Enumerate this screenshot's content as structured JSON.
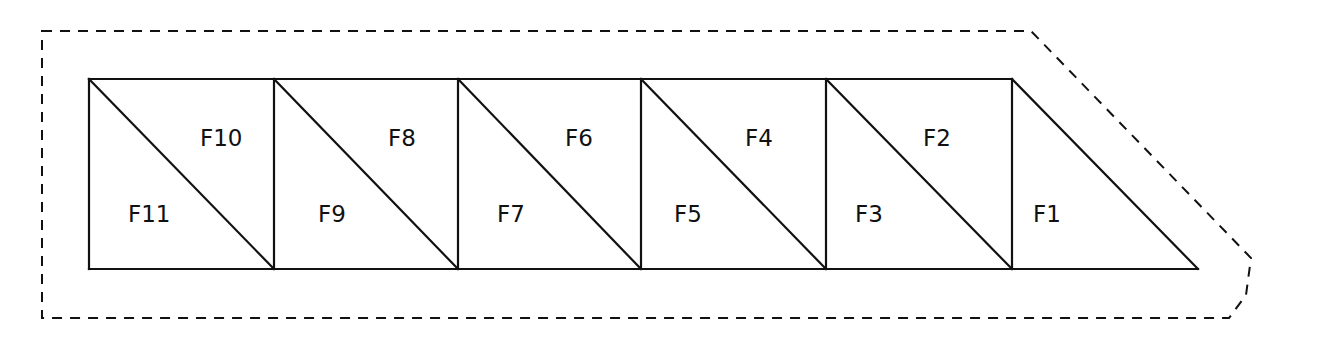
{
  "diagram": {
    "type": "truss-facet-layout",
    "outline": {
      "style": "dashed",
      "points": [
        [
          42,
          31
        ],
        [
          1031,
          31
        ],
        [
          1251,
          258
        ],
        [
          1246,
          295
        ],
        [
          1229,
          318
        ],
        [
          42,
          318
        ]
      ]
    },
    "truss": {
      "top_y": 79,
      "bottom_y": 269,
      "node_x": [
        89,
        274,
        458,
        641,
        826,
        1012
      ],
      "apex_x": 1198
    },
    "facets": [
      {
        "id": "F1",
        "label": "F1",
        "x": 1033,
        "y": 222
      },
      {
        "id": "F2",
        "label": "F2",
        "x": 923,
        "y": 146
      },
      {
        "id": "F3",
        "label": "F3",
        "x": 855,
        "y": 222
      },
      {
        "id": "F4",
        "label": "F4",
        "x": 745,
        "y": 146
      },
      {
        "id": "F5",
        "label": "F5",
        "x": 674,
        "y": 222
      },
      {
        "id": "F6",
        "label": "F6",
        "x": 565,
        "y": 146
      },
      {
        "id": "F7",
        "label": "F7",
        "x": 497,
        "y": 222
      },
      {
        "id": "F8",
        "label": "F8",
        "x": 388,
        "y": 146
      },
      {
        "id": "F9",
        "label": "F9",
        "x": 318,
        "y": 222
      },
      {
        "id": "F10",
        "label": "F10",
        "x": 200,
        "y": 146
      },
      {
        "id": "F11",
        "label": "F11",
        "x": 128,
        "y": 222
      }
    ]
  }
}
